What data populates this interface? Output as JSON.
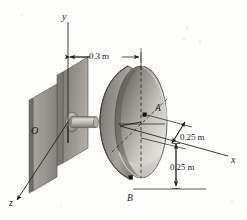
{
  "figure": {
    "background_color": "#fdfdfc",
    "line_color": "#1a1a1a",
    "axes": {
      "y_label": "y",
      "x_label": "x",
      "z_label": "z",
      "origin_label": "O"
    },
    "points": [
      {
        "id": "A",
        "label": "A",
        "marker": "square-marker"
      },
      {
        "id": "B",
        "label": "B",
        "marker": "square-marker"
      }
    ],
    "dimensions": [
      {
        "id": "d1",
        "label": "0.3 m",
        "orientation": "horizontal",
        "value": 0.3,
        "unit": "m"
      },
      {
        "id": "d2",
        "label": "0.25 m",
        "orientation": "diagonal",
        "value": 0.25,
        "unit": "m"
      },
      {
        "id": "d3",
        "label": "0.25 m",
        "orientation": "vertical",
        "value": 0.25,
        "unit": "m"
      }
    ],
    "parts": {
      "wall_label": "wall-plate",
      "shaft_label": "shaft",
      "collar_label": "shaft-collar",
      "dish_label": "parabolic-dish"
    },
    "colors": {
      "wall_fill": "#9b9892",
      "wall_edge": "#6f6c67",
      "dish_outer": "#8e8b86",
      "dish_inner": "#d8d5d0",
      "shaft_fill": "#b9b6b1",
      "marker": "#141414"
    }
  }
}
